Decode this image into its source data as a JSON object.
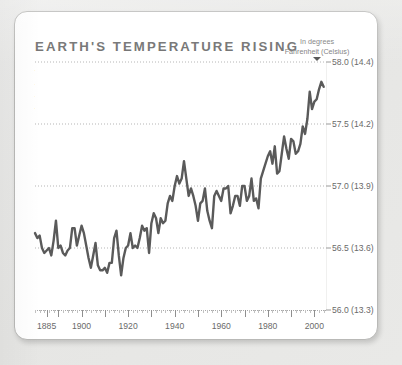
{
  "card": {
    "title": "EARTH'S TEMPERATURE RISING",
    "blurb": "This graph shows Earth's average temperature from all four seasons and from varying climates. Earth's temperature has risen almost steadily in the past century. Temperatures have increased most dramatically since 1980.",
    "legend_line1": "In degrees",
    "legend_line2": "Fahrenheit (Celsius)"
  },
  "colors": {
    "line": "#5a5a5a",
    "title": "#6e6e6e",
    "text": "#555555",
    "tick_text": "#6a6a6a",
    "grid": "#b5b5b5",
    "card_bg": "#ffffff",
    "page_bg": "#e8e8e6",
    "card_border": "#b9b9b7"
  },
  "chart_data": {
    "type": "line",
    "title": "EARTH'S TEMPERATURE RISING",
    "xlabel": "",
    "ylabel": "In degrees Fahrenheit (Celsius)",
    "xlim": [
      1880,
      2005
    ],
    "ylim": [
      56.0,
      58.0
    ],
    "grid": true,
    "grid_style": "dotted-horizontal",
    "legend_position": "top-right",
    "xticks": [
      1885,
      1900,
      1920,
      1940,
      1960,
      1980,
      2000
    ],
    "xtick_labels": [
      "1885",
      "1900",
      "1920",
      "1940",
      "1960",
      "1980",
      "2000"
    ],
    "yticks": [
      56.0,
      56.5,
      57.0,
      57.5,
      58.0
    ],
    "ytick_labels": [
      "56.0 (13.3)",
      "56.5 (13.6)",
      "57.0 (13.9)",
      "57.5 (14.2)",
      "58.0 (14.4)"
    ],
    "ytick_fahrenheit": [
      56.0,
      56.5,
      57.0,
      57.5,
      58.0
    ],
    "ytick_celsius": [
      13.3,
      13.6,
      13.9,
      14.2,
      14.4
    ],
    "series": [
      {
        "name": "Earth's average temperature",
        "x": [
          1880,
          1881,
          1882,
          1883,
          1884,
          1885,
          1886,
          1887,
          1888,
          1889,
          1890,
          1891,
          1892,
          1893,
          1894,
          1895,
          1896,
          1897,
          1898,
          1899,
          1900,
          1901,
          1902,
          1903,
          1904,
          1905,
          1906,
          1907,
          1908,
          1909,
          1910,
          1911,
          1912,
          1913,
          1914,
          1915,
          1916,
          1917,
          1918,
          1919,
          1920,
          1921,
          1922,
          1923,
          1924,
          1925,
          1926,
          1927,
          1928,
          1929,
          1930,
          1931,
          1932,
          1933,
          1934,
          1935,
          1936,
          1937,
          1938,
          1939,
          1940,
          1941,
          1942,
          1943,
          1944,
          1945,
          1946,
          1947,
          1948,
          1949,
          1950,
          1951,
          1952,
          1953,
          1954,
          1955,
          1956,
          1957,
          1958,
          1959,
          1960,
          1961,
          1962,
          1963,
          1964,
          1965,
          1966,
          1967,
          1968,
          1969,
          1970,
          1971,
          1972,
          1973,
          1974,
          1975,
          1976,
          1977,
          1978,
          1979,
          1980,
          1981,
          1982,
          1983,
          1984,
          1985,
          1986,
          1987,
          1988,
          1989,
          1990,
          1991,
          1992,
          1993,
          1994,
          1995,
          1996,
          1997,
          1998,
          1999,
          2000,
          2001,
          2002,
          2003,
          2004
        ],
        "values": [
          56.62,
          56.58,
          56.6,
          56.5,
          56.46,
          56.48,
          56.5,
          56.44,
          56.56,
          56.72,
          56.5,
          56.52,
          56.46,
          56.44,
          56.48,
          56.5,
          56.66,
          56.66,
          56.52,
          56.6,
          56.68,
          56.62,
          56.52,
          56.42,
          56.34,
          56.44,
          56.54,
          56.36,
          56.32,
          56.32,
          56.34,
          56.3,
          56.38,
          56.38,
          56.58,
          56.64,
          56.44,
          56.28,
          56.42,
          56.5,
          56.52,
          56.62,
          56.5,
          56.52,
          56.5,
          56.58,
          56.68,
          56.64,
          56.66,
          56.46,
          56.7,
          56.78,
          56.74,
          56.62,
          56.74,
          56.7,
          56.72,
          56.86,
          56.92,
          56.88,
          57.0,
          57.08,
          57.02,
          57.06,
          57.2,
          57.06,
          56.92,
          56.98,
          56.92,
          56.84,
          56.72,
          56.86,
          56.88,
          56.98,
          56.8,
          56.72,
          56.66,
          56.92,
          56.96,
          56.92,
          56.88,
          56.98,
          56.98,
          57.0,
          56.78,
          56.84,
          56.92,
          56.92,
          56.84,
          57.0,
          57.0,
          56.88,
          56.92,
          57.06,
          56.88,
          56.9,
          56.82,
          57.06,
          57.12,
          57.18,
          57.24,
          57.28,
          57.18,
          57.32,
          57.1,
          57.12,
          57.26,
          57.4,
          57.3,
          57.22,
          57.38,
          57.36,
          57.26,
          57.28,
          57.34,
          57.48,
          57.42,
          57.54,
          57.76,
          57.62,
          57.68,
          57.7,
          57.78,
          57.84,
          57.8
        ],
        "units": "degrees Fahrenheit",
        "color": "#5a5a5a"
      }
    ]
  }
}
